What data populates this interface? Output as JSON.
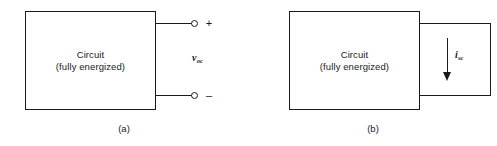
{
  "figure": {
    "panels": [
      {
        "id": "a",
        "caption": "(a)",
        "box_text": "Circuit\n(fully energized)",
        "terminal_positive": "+",
        "terminal_negative": "–",
        "variable_symbol": "v",
        "variable_subscript": "oc",
        "condition": "open-circuit"
      },
      {
        "id": "b",
        "caption": "(b)",
        "box_text": "Circuit\n(fully energized)",
        "variable_symbol": "i",
        "variable_subscript": "sc",
        "condition": "short-circuit"
      }
    ]
  },
  "colors": {
    "line": "#1a1a1a",
    "background": "#ffffff",
    "text": "#1a1a1a"
  }
}
